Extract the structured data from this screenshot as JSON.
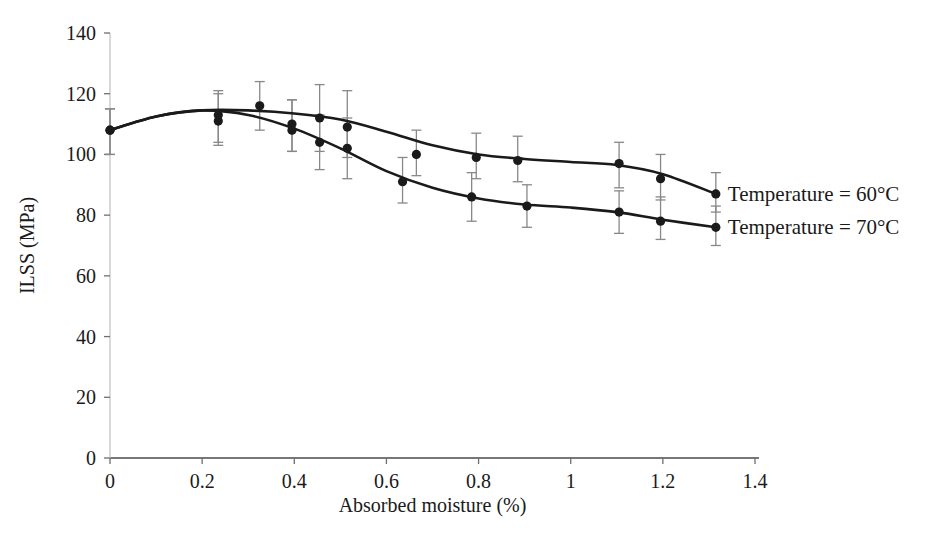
{
  "chart_data": {
    "type": "line",
    "title": "",
    "xlabel": "Absorbed moisture (%)",
    "ylabel": "ILSS (MPa)",
    "xlim": [
      0,
      1.4
    ],
    "ylim": [
      0,
      140
    ],
    "xticks": [
      "0",
      "0.2",
      "0.4",
      "0.6",
      "0.8",
      "1",
      "1.2",
      "1.4"
    ],
    "xtick_values": [
      0,
      0.2,
      0.4,
      0.6,
      0.8,
      1,
      1.2,
      1.4
    ],
    "yticks": [
      "0",
      "20",
      "40",
      "60",
      "80",
      "100",
      "120",
      "140"
    ],
    "ytick_values": [
      0,
      20,
      40,
      60,
      80,
      100,
      120,
      140
    ],
    "grid": false,
    "legend_position": "right-inline",
    "marker": "filled-circle",
    "error_bars": true,
    "series": [
      {
        "name": "Temperature = 60°C",
        "label": "Temperature = 60°C",
        "color": "#1a1a1a",
        "points": [
          {
            "x": 0.0,
            "y": 108,
            "yerr_low": 100,
            "yerr_high": 115
          },
          {
            "x": 0.235,
            "y": 113,
            "yerr_low": 104,
            "yerr_high": 121
          },
          {
            "x": 0.325,
            "y": 116,
            "yerr_low": 108,
            "yerr_high": 124
          },
          {
            "x": 0.395,
            "y": 108,
            "yerr_low": 101,
            "yerr_high": 118
          },
          {
            "x": 0.455,
            "y": 112,
            "yerr_low": 101,
            "yerr_high": 123
          },
          {
            "x": 0.515,
            "y": 109,
            "yerr_low": 99,
            "yerr_high": 121
          },
          {
            "x": 0.665,
            "y": 100,
            "yerr_low": 93,
            "yerr_high": 108
          },
          {
            "x": 0.795,
            "y": 99,
            "yerr_low": 92,
            "yerr_high": 107
          },
          {
            "x": 0.885,
            "y": 98,
            "yerr_low": 91,
            "yerr_high": 106
          },
          {
            "x": 1.105,
            "y": 97,
            "yerr_low": 89,
            "yerr_high": 104
          },
          {
            "x": 1.195,
            "y": 92,
            "yerr_low": 85,
            "yerr_high": 100
          },
          {
            "x": 1.315,
            "y": 87,
            "yerr_low": 81,
            "yerr_high": 94
          }
        ],
        "curve": [
          {
            "x": 0.0,
            "y": 108
          },
          {
            "x": 0.1,
            "y": 112.5
          },
          {
            "x": 0.2,
            "y": 114.5
          },
          {
            "x": 0.3,
            "y": 114.5
          },
          {
            "x": 0.4,
            "y": 113.5
          },
          {
            "x": 0.5,
            "y": 111.5
          },
          {
            "x": 0.6,
            "y": 107.5
          },
          {
            "x": 0.7,
            "y": 103
          },
          {
            "x": 0.8,
            "y": 100
          },
          {
            "x": 0.9,
            "y": 98.5
          },
          {
            "x": 1.0,
            "y": 97.5
          },
          {
            "x": 1.1,
            "y": 96.5
          },
          {
            "x": 1.2,
            "y": 93.5
          },
          {
            "x": 1.315,
            "y": 87
          }
        ]
      },
      {
        "name": "Temperature = 70°C",
        "label": "Temperature = 70°C",
        "color": "#1a1a1a",
        "points": [
          {
            "x": 0.0,
            "y": 108,
            "yerr_low": 100,
            "yerr_high": 115
          },
          {
            "x": 0.235,
            "y": 111,
            "yerr_low": 103,
            "yerr_high": 120
          },
          {
            "x": 0.395,
            "y": 110,
            "yerr_low": 101,
            "yerr_high": 118
          },
          {
            "x": 0.455,
            "y": 104,
            "yerr_low": 95,
            "yerr_high": 113
          },
          {
            "x": 0.515,
            "y": 102,
            "yerr_low": 92,
            "yerr_high": 112
          },
          {
            "x": 0.635,
            "y": 91,
            "yerr_low": 84,
            "yerr_high": 99
          },
          {
            "x": 0.785,
            "y": 86,
            "yerr_low": 78,
            "yerr_high": 94
          },
          {
            "x": 0.905,
            "y": 83,
            "yerr_low": 76,
            "yerr_high": 90
          },
          {
            "x": 1.105,
            "y": 81,
            "yerr_low": 74,
            "yerr_high": 88
          },
          {
            "x": 1.195,
            "y": 78,
            "yerr_low": 72,
            "yerr_high": 86
          },
          {
            "x": 1.315,
            "y": 76,
            "yerr_low": 70,
            "yerr_high": 83
          }
        ],
        "curve": [
          {
            "x": 0.0,
            "y": 108
          },
          {
            "x": 0.1,
            "y": 112.5
          },
          {
            "x": 0.2,
            "y": 114.5
          },
          {
            "x": 0.3,
            "y": 113
          },
          {
            "x": 0.4,
            "y": 108.5
          },
          {
            "x": 0.5,
            "y": 102
          },
          {
            "x": 0.6,
            "y": 94.5
          },
          {
            "x": 0.7,
            "y": 89
          },
          {
            "x": 0.8,
            "y": 85.5
          },
          {
            "x": 0.9,
            "y": 83.5
          },
          {
            "x": 1.0,
            "y": 82.5
          },
          {
            "x": 1.1,
            "y": 81
          },
          {
            "x": 1.2,
            "y": 78.5
          },
          {
            "x": 1.315,
            "y": 76
          }
        ]
      }
    ]
  },
  "caption": {
    "text": ""
  }
}
